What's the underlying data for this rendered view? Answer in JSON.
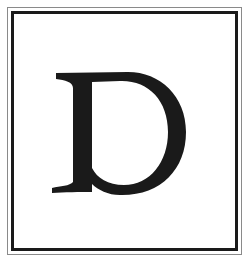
{
  "image": {
    "letter": "D",
    "description": "Serif capital letter D inside a double-line rectangular frame"
  },
  "colors": {
    "background": "#ffffff",
    "letter": "#1a1a1a",
    "frame_inner": "#1a1a1a",
    "frame_outer": "#8a8a8a"
  }
}
